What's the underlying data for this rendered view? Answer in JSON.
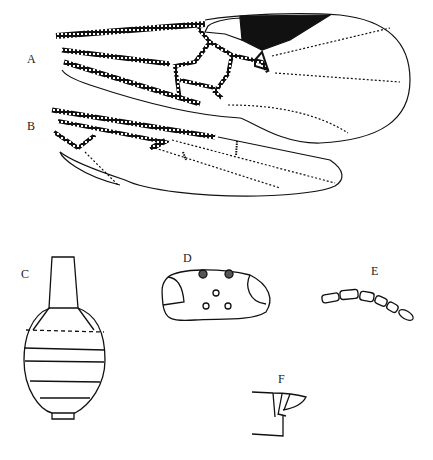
{
  "figure": {
    "panels": [
      {
        "id": "A",
        "label": "A",
        "content": "forewing"
      },
      {
        "id": "B",
        "label": "B",
        "content": "hindwing"
      },
      {
        "id": "C",
        "label": "C",
        "content": "gaster, dorsal view"
      },
      {
        "id": "D",
        "label": "D",
        "content": "head, dorsal view"
      },
      {
        "id": "E",
        "label": "E",
        "content": "antennal segments"
      },
      {
        "id": "F",
        "label": "F",
        "content": "ovipositor tip"
      }
    ],
    "colors": {
      "ink": "#111111",
      "background": "#ffffff"
    }
  }
}
